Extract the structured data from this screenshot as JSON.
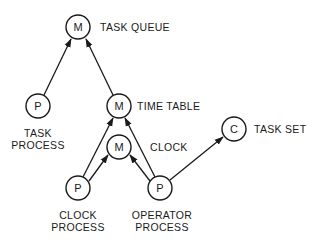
{
  "diagram": {
    "nodes": [
      {
        "id": "task_queue",
        "letter": "M",
        "label": "TASK QUEUE",
        "cx": 78,
        "cy": 27
      },
      {
        "id": "task_process",
        "letter": "P",
        "label_lines": [
          "TASK",
          "PROCESS"
        ],
        "cx": 38,
        "cy": 106
      },
      {
        "id": "time_table",
        "letter": "M",
        "label": "TIME TABLE",
        "cx": 119,
        "cy": 106
      },
      {
        "id": "clock",
        "letter": "M",
        "label": "CLOCK",
        "cx": 119,
        "cy": 147
      },
      {
        "id": "clock_process",
        "letter": "P",
        "label_lines": [
          "CLOCK",
          "PROCESS"
        ],
        "cx": 78,
        "cy": 188
      },
      {
        "id": "operator_process",
        "letter": "P",
        "label_lines": [
          "OPERATOR",
          "PROCESS"
        ],
        "cx": 160,
        "cy": 188
      },
      {
        "id": "task_set",
        "letter": "C",
        "label": "TASK SET",
        "cx": 234,
        "cy": 129
      }
    ],
    "edges": [
      {
        "from": "task_process",
        "to": "task_queue"
      },
      {
        "from": "time_table",
        "to": "task_queue"
      },
      {
        "from": "clock_process",
        "to": "time_table"
      },
      {
        "from": "clock_process",
        "to": "clock"
      },
      {
        "from": "operator_process",
        "to": "time_table"
      },
      {
        "from": "operator_process",
        "to": "clock"
      },
      {
        "from": "operator_process",
        "to": "task_set"
      }
    ],
    "labels": {
      "task_queue": "TASK QUEUE",
      "time_table": "TIME TABLE",
      "clock": "CLOCK",
      "task_set": "TASK SET",
      "task_process_1": "TASK",
      "task_process_2": "PROCESS",
      "clock_process_1": "CLOCK",
      "clock_process_2": "PROCESS",
      "operator_process_1": "OPERATOR",
      "operator_process_2": "PROCESS"
    },
    "letters": {
      "task_queue": "M",
      "task_process": "P",
      "time_table": "M",
      "clock": "M",
      "clock_process": "P",
      "operator_process": "P",
      "task_set": "C"
    },
    "colors": {
      "stroke": "#1a1a1a",
      "background": "#ffffff"
    }
  }
}
